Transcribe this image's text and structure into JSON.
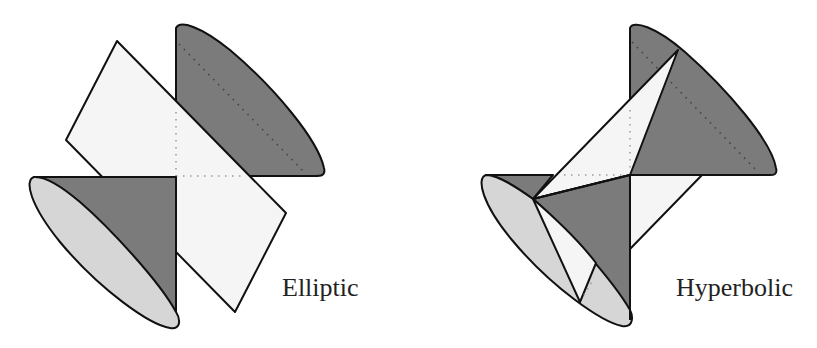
{
  "figures": [
    {
      "id": "elliptic",
      "label": "Elliptic"
    },
    {
      "id": "hyperbolic",
      "label": "Hyperbolic"
    }
  ],
  "colors": {
    "dark_face": "#7b7b7b",
    "ellipse_face": "#d6d6d6",
    "light_face": "#f5f5f5",
    "stroke": "#111111",
    "dots": "#555555",
    "light_dots": "#9a9a9a"
  }
}
